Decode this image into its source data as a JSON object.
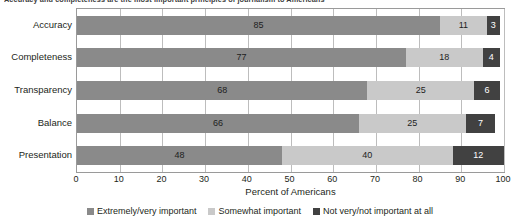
{
  "chart_data": {
    "type": "bar",
    "orientation": "horizontal",
    "stacked": true,
    "title": "Accuracy and completeness are the most important principles of journalism to Americans",
    "xlabel": "Percent of Americans",
    "ylabel": "",
    "xlim": [
      0,
      100
    ],
    "xticks": [
      0,
      10,
      20,
      30,
      40,
      50,
      60,
      70,
      80,
      90,
      100
    ],
    "grid": true,
    "legend_position": "bottom",
    "categories": [
      "Accuracy",
      "Completeness",
      "Transparency",
      "Balance",
      "Presentation"
    ],
    "series": [
      {
        "name": "Extremely/very important",
        "color": "#8a8a8a",
        "values": [
          85,
          77,
          68,
          66,
          48
        ]
      },
      {
        "name": "Somewhat important",
        "color": "#c9c9c9",
        "values": [
          11,
          18,
          25,
          25,
          40
        ]
      },
      {
        "name": "Not very/not important at all",
        "color": "#414141",
        "values": [
          3,
          4,
          6,
          7,
          12
        ]
      }
    ]
  }
}
